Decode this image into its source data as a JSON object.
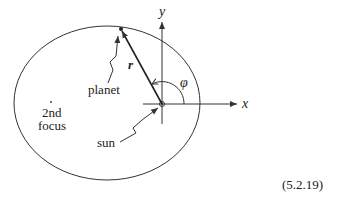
{
  "diagram": {
    "type": "orbit-ellipse",
    "labels": {
      "y_axis": "y",
      "x_axis": "x",
      "radius_vector": "r",
      "angle": "φ",
      "planet": "planet",
      "second_focus_line1": "2nd",
      "second_focus_line2": "focus",
      "sun": "sun"
    },
    "equation_number": "(5.2.19)",
    "colors": {
      "stroke": "#333333",
      "background": "#ffffff"
    }
  }
}
